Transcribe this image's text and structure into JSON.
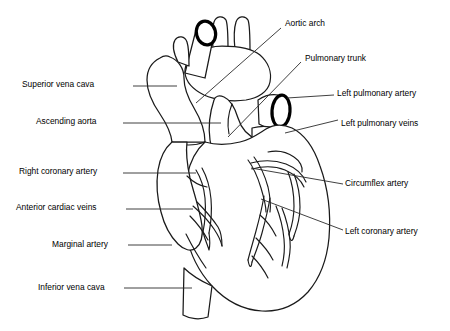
{
  "figure": {
    "background_color": "#ffffff",
    "line_color": "#1a1a1a",
    "leader_color": "#2b2b2b"
  },
  "labels_left": [
    {
      "id": "superior-vena-cava",
      "text": "Superior vena cava",
      "x": 22,
      "y": 80,
      "leader": {
        "x1": 133,
        "y1": 86,
        "x2": 177,
        "y2": 86
      }
    },
    {
      "id": "ascending-aorta",
      "text": "Ascending aorta",
      "x": 36,
      "y": 117,
      "leader": {
        "x1": 123,
        "y1": 123,
        "x2": 221,
        "y2": 123
      }
    },
    {
      "id": "right-coronary-artery",
      "text": "Right coronary artery",
      "x": 19,
      "y": 167,
      "leader": {
        "x1": 123,
        "y1": 173,
        "x2": 196,
        "y2": 173
      }
    },
    {
      "id": "anterior-cardiac-veins",
      "text": "Anterior cardiac veins",
      "x": 16,
      "y": 203,
      "leader": {
        "x1": 126,
        "y1": 209,
        "x2": 193,
        "y2": 209
      }
    },
    {
      "id": "marginal-artery",
      "text": "Marginal artery",
      "x": 52,
      "y": 240,
      "leader": {
        "x1": 128,
        "y1": 245,
        "x2": 172,
        "y2": 245
      }
    },
    {
      "id": "inferior-vena-cava",
      "text": "Inferior vena cava",
      "x": 38,
      "y": 283,
      "leader": {
        "x1": 124,
        "y1": 288,
        "x2": 192,
        "y2": 288
      }
    }
  ],
  "labels_right": [
    {
      "id": "aortic-arch",
      "text": "Aortic arch",
      "x": 285,
      "y": 19,
      "leader": {
        "x1": 281,
        "y1": 28,
        "x2": 196,
        "y2": 103
      }
    },
    {
      "id": "pulmonary-trunk",
      "text": "Pulmonary trunk",
      "x": 305,
      "y": 54,
      "leader": {
        "x1": 301,
        "y1": 62,
        "x2": 228,
        "y2": 137
      }
    },
    {
      "id": "left-pulmonary-artery",
      "text": "Left pulmonary artery",
      "x": 337,
      "y": 89,
      "leader": {
        "x1": 334,
        "y1": 95,
        "x2": 287,
        "y2": 98
      }
    },
    {
      "id": "left-pulmonary-veins",
      "text": "Left pulmonary veins",
      "x": 341,
      "y": 119,
      "leader": {
        "x1": 338,
        "y1": 120,
        "x2": 285,
        "y2": 133
      }
    },
    {
      "id": "circumflex-artery",
      "text": "Circumflex artery",
      "x": 345,
      "y": 179,
      "leader": {
        "x1": 343,
        "y1": 184,
        "x2": 251,
        "y2": 168
      }
    },
    {
      "id": "left-coronary-artery",
      "text": "Left coronary artery",
      "x": 345,
      "y": 227,
      "leader": {
        "x1": 343,
        "y1": 230,
        "x2": 261,
        "y2": 199
      }
    }
  ]
}
